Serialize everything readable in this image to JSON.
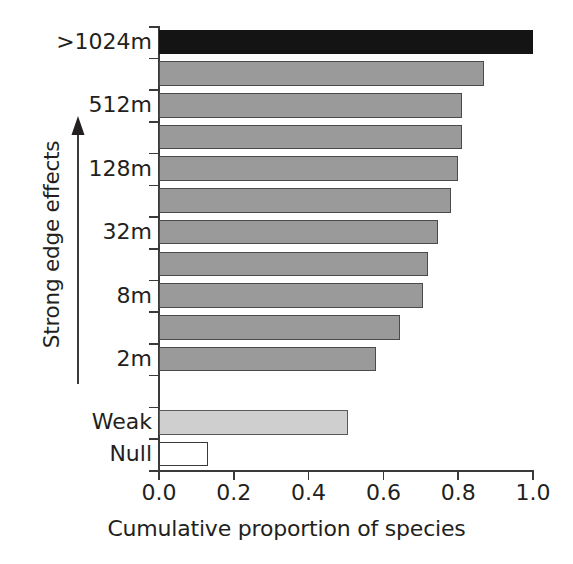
{
  "chart_data": {
    "type": "bar",
    "orientation": "horizontal",
    "title": "",
    "xlabel": "Cumulative proportion of species",
    "ylabel": "Strong edge effects",
    "xlim": [
      0.0,
      1.0
    ],
    "xticks": [
      "0.0",
      "0.2",
      "0.4",
      "0.6",
      "0.8",
      "1.0"
    ],
    "xtick_values": [
      0.0,
      0.2,
      0.4,
      0.6,
      0.8,
      1.0
    ],
    "grid": false,
    "legend": null,
    "categories": [
      ">1024m",
      "",
      "512m",
      "",
      "128m",
      "",
      "32m",
      "",
      "8m",
      "",
      "2m",
      "",
      "Weak",
      "Null"
    ],
    "ytick_labels_visible": [
      ">1024m",
      "512m",
      "128m",
      "32m",
      "8m",
      "2m",
      "Weak",
      "Null"
    ],
    "bars": [
      {
        "label": ">1024m",
        "value": 1.0,
        "style": "dark"
      },
      {
        "label": "",
        "value": 0.87,
        "style": "grey"
      },
      {
        "label": "512m",
        "value": 0.81,
        "style": "grey"
      },
      {
        "label": "",
        "value": 0.81,
        "style": "grey"
      },
      {
        "label": "128m",
        "value": 0.8,
        "style": "grey"
      },
      {
        "label": "",
        "value": 0.78,
        "style": "grey"
      },
      {
        "label": "32m",
        "value": 0.745,
        "style": "grey"
      },
      {
        "label": "",
        "value": 0.72,
        "style": "grey"
      },
      {
        "label": "8m",
        "value": 0.705,
        "style": "grey"
      },
      {
        "label": "",
        "value": 0.645,
        "style": "grey"
      },
      {
        "label": "2m",
        "value": 0.58,
        "style": "grey"
      },
      {
        "label": "",
        "value": 0.0,
        "style": "none"
      },
      {
        "label": "Weak",
        "value": 0.505,
        "style": "light"
      },
      {
        "label": "Null",
        "value": 0.13,
        "style": "empty"
      }
    ],
    "colors": {
      "dark": "#141414",
      "grey": "#9a9a9a",
      "light": "#cfcfcf",
      "empty": "#ffffff",
      "axis": "#3a3a3a",
      "text": "#231f20"
    },
    "annotations": [
      {
        "name": "edge-effect-arrow",
        "text": "Strong edge effects",
        "direction": "up"
      }
    ]
  }
}
